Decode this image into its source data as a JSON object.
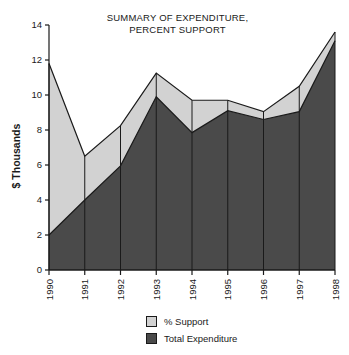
{
  "chart_data": {
    "type": "area",
    "title": "SUMMARY OF EXPENDITURE,\nPERCENT SUPPORT",
    "xlabel": "",
    "ylabel": "$ Thousands",
    "categories": [
      "1990",
      "1991",
      "1992",
      "1993",
      "1994",
      "1995",
      "1996",
      "1997",
      "1998"
    ],
    "x": [
      1990,
      1991,
      1992,
      1993,
      1994,
      1995,
      1996,
      1997,
      1998
    ],
    "ylim": [
      0,
      14
    ],
    "xlim": [
      1990,
      1998
    ],
    "yticks": [
      0,
      2,
      4,
      6,
      8,
      10,
      12,
      14
    ],
    "ytick_labels": [
      "0",
      "2",
      "4",
      "6",
      "8",
      "10",
      "12",
      "14"
    ],
    "grid": "vertical-only",
    "legend_position": "bottom-center",
    "series": [
      {
        "name": "% Support",
        "color": "#d2d2d2",
        "values": [
          11.8,
          6.5,
          8.25,
          11.25,
          9.7,
          9.7,
          9.05,
          10.5,
          13.6
        ]
      },
      {
        "name": "Total Expenditure",
        "color": "#4a4a4a",
        "values": [
          2.0,
          4.0,
          5.95,
          9.9,
          7.85,
          9.1,
          8.6,
          9.05,
          13.1
        ]
      }
    ]
  },
  "legend": {
    "items": [
      {
        "label": "% Support",
        "color": "#d2d2d2"
      },
      {
        "label": "Total Expenditure",
        "color": "#4a4a4a"
      }
    ]
  },
  "colors": {
    "support_fill": "#d2d2d2",
    "expenditure_fill": "#4a4a4a",
    "axis": "#1a1a1a",
    "background": "#ffffff"
  }
}
